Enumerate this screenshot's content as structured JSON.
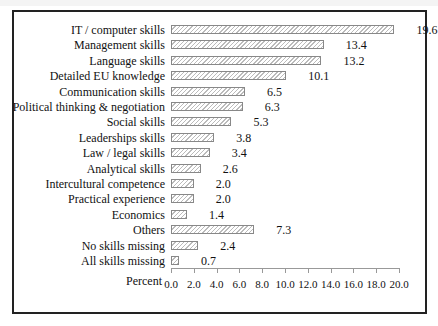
{
  "chart_data": {
    "type": "bar",
    "orientation": "horizontal",
    "title": "",
    "xlabel": "Percent",
    "ylabel": "",
    "xlim": [
      0,
      20
    ],
    "xticks": [
      "0.0",
      "2.0",
      "4.0",
      "6.0",
      "8.0",
      "10.0",
      "12.0",
      "14.0",
      "16.0",
      "18.0",
      "20.0"
    ],
    "grid": false,
    "legend": null,
    "categories": [
      "IT / computer skills",
      "Management skills",
      "Language skills",
      "Detailed EU knowledge",
      "Communication skills",
      "Political thinking & negotiation",
      "Social skills",
      "Leaderships skills",
      "Law / legal skills",
      "Analytical skills",
      "Intercultural competence",
      "Practical experience",
      "Economics",
      "Others",
      "No skills missing",
      "All skills missing"
    ],
    "values": [
      19.6,
      13.4,
      13.2,
      10.1,
      6.5,
      6.3,
      5.3,
      3.8,
      3.4,
      2.6,
      2.0,
      2.0,
      1.4,
      7.3,
      2.4,
      0.7
    ],
    "value_labels": [
      "19.6",
      "13.4",
      "13.2",
      "10.1",
      "6.5",
      "6.3",
      "5.3",
      "3.8",
      "3.4",
      "2.6",
      "2.0",
      "2.0",
      "1.4",
      "7.3",
      "2.4",
      "0.7"
    ],
    "bar_style": "diagonal-hatch",
    "colors": {
      "bar_border": "#888888",
      "hatch": "#bbbbbb",
      "frame": "#222222"
    }
  }
}
